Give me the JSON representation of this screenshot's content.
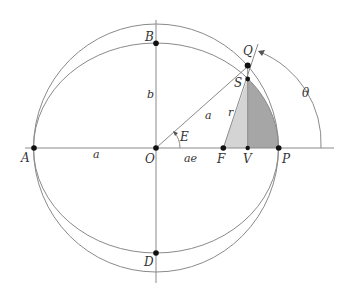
{
  "diagram": {
    "points": {
      "A": "A",
      "B": "B",
      "D": "D",
      "O": "O",
      "F": "F",
      "V": "V",
      "P": "P",
      "Q": "Q",
      "S": "S"
    },
    "segment_labels": {
      "a_left": "a",
      "b": "b",
      "a_radius": "a",
      "ae": "ae",
      "r": "r"
    },
    "angle_labels": {
      "E": "E",
      "theta": "θ"
    },
    "colors": {
      "line": "#8a8a8a",
      "point": "#111111",
      "shade_light": "#d4d4d4",
      "shade_dark": "#a6a6a6",
      "text": "#333333"
    }
  }
}
